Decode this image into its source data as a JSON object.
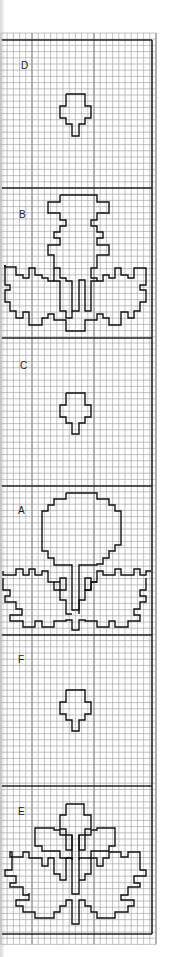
{
  "chart": {
    "grid": {
      "cell_px": 6.2,
      "origin_x": 1,
      "origin_y": 33,
      "columns": 25,
      "rows": 147,
      "major_every": 10,
      "minor_color": "#9a9a9a",
      "major_color": "#555555",
      "frame_color": "#222222"
    },
    "frame": {
      "left": 2,
      "right": 152,
      "top": 40,
      "bottom": 934
    },
    "dividers": [
      188,
      338,
      486,
      635,
      786
    ],
    "sections": [
      {
        "label": "D",
        "label_x": 21,
        "label_y": 69,
        "motif": "small-bud"
      },
      {
        "label": "B",
        "label_x": 19,
        "label_y": 218,
        "motif": "thistle-with-leaves"
      },
      {
        "label": "C",
        "label_x": 20,
        "label_y": 369,
        "motif": "small-bud"
      },
      {
        "label": "A",
        "label_x": 18,
        "label_y": 514,
        "motif": "round-flower-with-leaves"
      },
      {
        "label": "F",
        "label_x": 18,
        "label_y": 663,
        "motif": "small-bud"
      },
      {
        "label": "E",
        "label_x": 18,
        "label_y": 815,
        "motif": "bud-with-leaves"
      }
    ]
  }
}
